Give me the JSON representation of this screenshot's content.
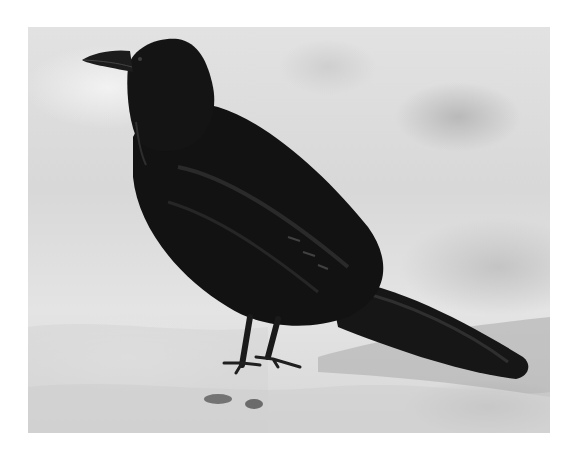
{
  "image": {
    "subject": "raven",
    "description": "Black-and-white photograph of a common raven standing on snowy ground, facing left",
    "background_color": "#ffffff",
    "colors": {
      "snow_light": "#e2e2e2",
      "snow_shadow": "#b5b5b5",
      "bird_black": "#141414",
      "bird_sheen": "#3a3a3a"
    }
  }
}
